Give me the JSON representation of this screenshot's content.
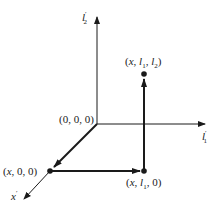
{
  "diagram": {
    "type": "3d-coordinate-path",
    "axes": {
      "vertical": {
        "label": "l′2",
        "label_main": "l",
        "label_sup": "′",
        "label_sub": "2"
      },
      "horizontal": {
        "label": "l′1",
        "label_main": "l",
        "label_sup": "′",
        "label_sub": "1"
      },
      "depth": {
        "label": "x′",
        "label_main": "x",
        "label_sup": "′"
      }
    },
    "points": [
      {
        "id": "origin",
        "label": "(0, 0, 0)"
      },
      {
        "id": "p1",
        "label": "(x, 0, 0)"
      },
      {
        "id": "p2",
        "label": "(x, l1, 0)",
        "parts": [
          "(",
          "x",
          ", ",
          "l",
          "1",
          ", 0)"
        ]
      },
      {
        "id": "p3",
        "label": "(x, l1, l2)",
        "parts": [
          "(",
          "x",
          ", ",
          "l",
          "1",
          ", ",
          "l",
          "2",
          ")"
        ]
      }
    ],
    "path": [
      "origin",
      "p1",
      "p2",
      "p3"
    ],
    "colors": {
      "line": "#1a1a1a",
      "background": "#ffffff"
    }
  }
}
